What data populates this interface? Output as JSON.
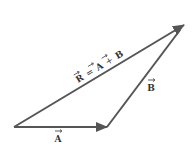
{
  "diagram": {
    "type": "vector-addition-triangle",
    "colors": {
      "line": "#555555",
      "text": "#333333",
      "background": "#ffffff"
    },
    "vectors": [
      {
        "name": "A",
        "label": "A",
        "from": [
          14,
          127
        ],
        "to": [
          107,
          127
        ]
      },
      {
        "name": "B",
        "label": "B",
        "from": [
          107,
          127
        ],
        "to": [
          184,
          25
        ]
      },
      {
        "name": "R",
        "label": "R = A + B",
        "from": [
          14,
          127
        ],
        "to": [
          184,
          25
        ]
      }
    ],
    "labels": {
      "a": "A",
      "b": "B",
      "r_lhs": "R",
      "r_eq": "=",
      "r_a": "A",
      "r_plus": "+",
      "r_b": "B"
    }
  }
}
